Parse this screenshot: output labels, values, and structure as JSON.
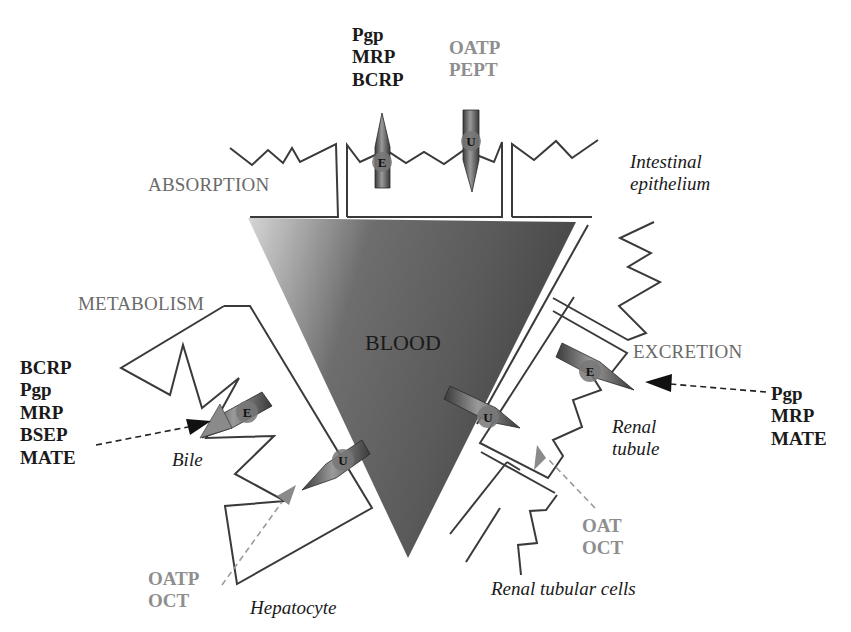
{
  "regions": {
    "absorption": "ABSORPTION",
    "metabolism": "METABOLISM",
    "excretion": "EXCRETION",
    "blood": "BLOOD"
  },
  "tissues": {
    "intestinal_line1": "Intestinal",
    "intestinal_line2": "epithelium",
    "bile": "Bile",
    "hepatocyte": "Hepatocyte",
    "renal_tubule_line1": "Renal",
    "renal_tubule_line2": "tubule",
    "renal_tubular_cells": "Renal tubular cells"
  },
  "transporter_markers": {
    "efflux": "E",
    "uptake": "U"
  },
  "transporters": {
    "intestine_efflux": [
      "Pgp",
      "MRP",
      "BCRP"
    ],
    "intestine_uptake": [
      "OATP",
      "PEPT"
    ],
    "liver_efflux": [
      "BCRP",
      "Pgp",
      "MRP",
      "BSEP",
      "MATE"
    ],
    "liver_uptake": [
      "OATP",
      "OCT"
    ],
    "kidney_efflux": [
      "Pgp",
      "MRP",
      "MATE"
    ],
    "kidney_uptake": [
      "OAT",
      "OCT"
    ]
  },
  "colors": {
    "efflux_label": "#1a1a1a",
    "uptake_label": "#8e8e8e",
    "blood_dark": "#4a4a4a",
    "blood_light": "#c8c8c8",
    "outline": "#3a3a3a"
  }
}
